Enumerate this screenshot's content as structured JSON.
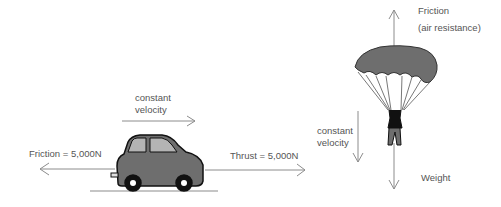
{
  "car_scene": {
    "velocity_label_line1": "constant",
    "velocity_label_line2": "velocity",
    "friction_label": "Friction = 5,000N",
    "thrust_label": "Thrust = 5,000N"
  },
  "parachute_scene": {
    "friction_label_line1": "Friction",
    "friction_label_line2": "(air resistance)",
    "velocity_label_line1": "constant",
    "velocity_label_line2": "velocity",
    "weight_label": "Weight"
  },
  "colors": {
    "body": "#6e6e6e",
    "window": "#b4b4b4",
    "arrow": "#8c8c8c",
    "text": "#555555"
  }
}
